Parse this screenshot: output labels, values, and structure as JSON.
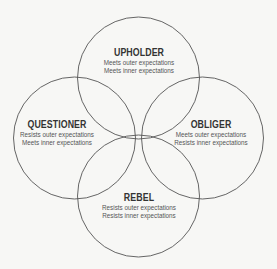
{
  "diagram": {
    "type": "four-circle-venn",
    "line_color": "#555555",
    "background": "#f7f7f5",
    "circles": [
      {
        "id": "upholder",
        "title": "UPHOLDER",
        "lines": [
          "Meets outer expectations",
          "Meets inner expectations"
        ],
        "position": "top"
      },
      {
        "id": "questioner",
        "title": "QUESTIONER",
        "lines": [
          "Resists outer expectations",
          "Meets inner expectations"
        ],
        "position": "left"
      },
      {
        "id": "obliger",
        "title": "OBLIGER",
        "lines": [
          "Meets outer expectations",
          "Resists inner expectations"
        ],
        "position": "right"
      },
      {
        "id": "rebel",
        "title": "REBEL",
        "lines": [
          "Resists outer expectations",
          "Resists inner expectations"
        ],
        "position": "bottom"
      }
    ]
  }
}
